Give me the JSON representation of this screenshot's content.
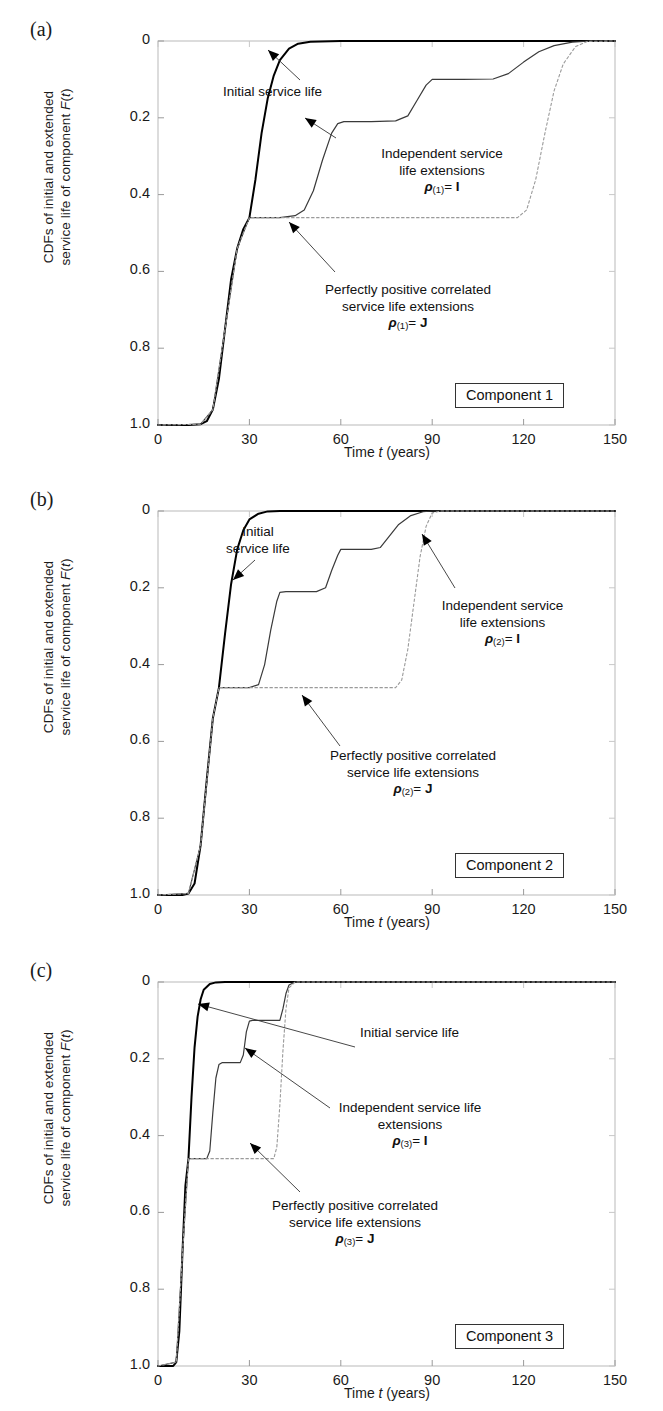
{
  "figure": {
    "panels": [
      {
        "letter": "(a)",
        "component_label": "Component 1",
        "ylabel_line1": "CDFs of initial and extended",
        "ylabel_line2_a": "service life of component ",
        "ylabel_line2_b": "F",
        "ylabel_line2_c": "(",
        "ylabel_line2_d": "t",
        "ylabel_line2_e": ")",
        "xlabel_a": "Time ",
        "xlabel_b": "t",
        "xlabel_c": " (years)",
        "yticks": [
          "1.0",
          "0.8",
          "0.6",
          "0.4",
          "0.2",
          "0"
        ],
        "xticks": [
          "0",
          "30",
          "60",
          "90",
          "120",
          "150"
        ],
        "annotations": [
          {
            "name": "initial-service-life",
            "lines": [
              "Initial service life"
            ]
          },
          {
            "name": "independent-extensions",
            "lines": [
              "Independent service",
              "life extensions"
            ],
            "rho": "ρ",
            "sub": "(1)",
            "eq": "= ",
            "matrix": "I"
          },
          {
            "name": "perfectly-correlated-extensions",
            "lines": [
              "Perfectly positive correlated",
              "service life extensions"
            ],
            "rho": "ρ",
            "sub": "(1)",
            "eq": "= ",
            "matrix": "J"
          }
        ]
      },
      {
        "letter": "(b)",
        "component_label": "Component 2",
        "ylabel_line1": "CDFs of initial and extended",
        "ylabel_line2_a": "service life of component ",
        "ylabel_line2_b": "F",
        "ylabel_line2_c": "(",
        "ylabel_line2_d": "t",
        "ylabel_line2_e": ")",
        "xlabel_a": "Time ",
        "xlabel_b": "t",
        "xlabel_c": " (years)",
        "yticks": [
          "1.0",
          "0.8",
          "0.6",
          "0.4",
          "0.2",
          "0"
        ],
        "xticks": [
          "0",
          "30",
          "60",
          "90",
          "120",
          "150"
        ],
        "annotations": [
          {
            "name": "initial-service-life",
            "lines": [
              "Initial",
              "service life"
            ]
          },
          {
            "name": "independent-extensions",
            "lines": [
              "Independent service",
              "life extensions"
            ],
            "rho": "ρ",
            "sub": "(2)",
            "eq": "= ",
            "matrix": "I"
          },
          {
            "name": "perfectly-correlated-extensions",
            "lines": [
              "Perfectly positive correlated",
              "service life extensions"
            ],
            "rho": "ρ",
            "sub": "(2)",
            "eq": "= ",
            "matrix": "J"
          }
        ]
      },
      {
        "letter": "(c)",
        "component_label": "Component 3",
        "ylabel_line1": "CDFs of initial and extended",
        "ylabel_line2_a": "service life of component ",
        "ylabel_line2_b": "F",
        "ylabel_line2_c": "(",
        "ylabel_line2_d": "t",
        "ylabel_line2_e": ")",
        "xlabel_a": "Time ",
        "xlabel_b": "t",
        "xlabel_c": " (years)",
        "yticks": [
          "1.0",
          "0.8",
          "0.6",
          "0.4",
          "0.2",
          "0"
        ],
        "xticks": [
          "0",
          "30",
          "60",
          "90",
          "120",
          "150"
        ],
        "annotations": [
          {
            "name": "initial-service-life",
            "lines": [
              "Initial service life"
            ]
          },
          {
            "name": "independent-extensions",
            "lines": [
              "Independent service life",
              "extensions"
            ],
            "rho": "ρ",
            "sub": "(3)",
            "eq": "= ",
            "matrix": "I"
          },
          {
            "name": "perfectly-correlated-extensions",
            "lines": [
              "Perfectly positive correlated",
              "service life extensions"
            ],
            "rho": "ρ",
            "sub": "(3)",
            "eq": "= ",
            "matrix": "J"
          }
        ]
      }
    ]
  },
  "chart_data": [
    {
      "type": "line",
      "panel": "(a)",
      "title": "Component 1",
      "xlabel": "Time t (years)",
      "ylabel": "CDFs of initial and extended service life of component F(t)",
      "xlim": [
        0,
        150
      ],
      "ylim": [
        0,
        1.0
      ],
      "xticks": [
        0,
        30,
        60,
        90,
        120,
        150
      ],
      "yticks": [
        0,
        0.2,
        0.4,
        0.6,
        0.8,
        1.0
      ],
      "grid": false,
      "legend": "annotations-inline",
      "series": [
        {
          "name": "Initial service life",
          "style": "solid-thick",
          "color": "#000000",
          "points": [
            [
              0,
              0.0
            ],
            [
              10,
              0.0
            ],
            [
              14,
              0.002
            ],
            [
              16,
              0.01
            ],
            [
              18,
              0.04
            ],
            [
              20,
              0.12
            ],
            [
              22,
              0.25
            ],
            [
              24,
              0.38
            ],
            [
              26,
              0.46
            ],
            [
              28,
              0.51
            ],
            [
              30,
              0.54
            ],
            [
              32,
              0.64
            ],
            [
              34,
              0.76
            ],
            [
              36,
              0.85
            ],
            [
              38,
              0.91
            ],
            [
              40,
              0.95
            ],
            [
              43,
              0.98
            ],
            [
              46,
              0.993
            ],
            [
              50,
              0.998
            ],
            [
              60,
              1.0
            ],
            [
              150,
              1.0
            ]
          ]
        },
        {
          "name": "Independent service life extensions, rho_(1) = I",
          "style": "solid-thin",
          "color": "#3a3a3a",
          "points": [
            [
              0,
              0.0
            ],
            [
              14,
              0.002
            ],
            [
              18,
              0.04
            ],
            [
              22,
              0.25
            ],
            [
              26,
              0.46
            ],
            [
              30,
              0.54
            ],
            [
              40,
              0.54
            ],
            [
              45,
              0.545
            ],
            [
              48,
              0.56
            ],
            [
              51,
              0.61
            ],
            [
              54,
              0.69
            ],
            [
              57,
              0.76
            ],
            [
              59,
              0.785
            ],
            [
              61,
              0.79
            ],
            [
              70,
              0.79
            ],
            [
              78,
              0.792
            ],
            [
              82,
              0.805
            ],
            [
              85,
              0.845
            ],
            [
              88,
              0.885
            ],
            [
              90,
              0.9
            ],
            [
              100,
              0.9
            ],
            [
              110,
              0.901
            ],
            [
              115,
              0.915
            ],
            [
              120,
              0.945
            ],
            [
              125,
              0.972
            ],
            [
              130,
              0.988
            ],
            [
              136,
              0.997
            ],
            [
              142,
              1.0
            ],
            [
              150,
              1.0
            ]
          ]
        },
        {
          "name": "Perfectly positive correlated service life extensions, rho_(1) = J",
          "style": "dotted",
          "color": "#9a9a9a",
          "points": [
            [
              0,
              0.0
            ],
            [
              14,
              0.002
            ],
            [
              18,
              0.04
            ],
            [
              22,
              0.25
            ],
            [
              26,
              0.46
            ],
            [
              30,
              0.54
            ],
            [
              60,
              0.54
            ],
            [
              90,
              0.54
            ],
            [
              118,
              0.54
            ],
            [
              121,
              0.56
            ],
            [
              124,
              0.64
            ],
            [
              127,
              0.76
            ],
            [
              130,
              0.87
            ],
            [
              133,
              0.94
            ],
            [
              137,
              0.985
            ],
            [
              141,
              0.999
            ],
            [
              150,
              1.0
            ]
          ]
        }
      ]
    },
    {
      "type": "line",
      "panel": "(b)",
      "title": "Component 2",
      "xlabel": "Time t (years)",
      "ylabel": "CDFs of initial and extended service life of component F(t)",
      "xlim": [
        0,
        150
      ],
      "ylim": [
        0,
        1.0
      ],
      "xticks": [
        0,
        30,
        60,
        90,
        120,
        150
      ],
      "yticks": [
        0,
        0.2,
        0.4,
        0.6,
        0.8,
        1.0
      ],
      "grid": false,
      "legend": "annotations-inline",
      "series": [
        {
          "name": "Initial service life",
          "style": "solid-thick",
          "color": "#000000",
          "points": [
            [
              0,
              0.0
            ],
            [
              8,
              0.0
            ],
            [
              10,
              0.004
            ],
            [
              12,
              0.03
            ],
            [
              14,
              0.13
            ],
            [
              16,
              0.3
            ],
            [
              18,
              0.46
            ],
            [
              20,
              0.54
            ],
            [
              22,
              0.68
            ],
            [
              24,
              0.81
            ],
            [
              26,
              0.9
            ],
            [
              28,
              0.95
            ],
            [
              30,
              0.978
            ],
            [
              33,
              0.993
            ],
            [
              36,
              0.999
            ],
            [
              40,
              1.0
            ],
            [
              150,
              1.0
            ]
          ]
        },
        {
          "name": "Independent service life extensions, rho_(2) = I",
          "style": "solid-thin",
          "color": "#3a3a3a",
          "points": [
            [
              0,
              0.0
            ],
            [
              10,
              0.004
            ],
            [
              14,
              0.13
            ],
            [
              18,
              0.46
            ],
            [
              20,
              0.54
            ],
            [
              30,
              0.54
            ],
            [
              33,
              0.548
            ],
            [
              35,
              0.6
            ],
            [
              37,
              0.69
            ],
            [
              39,
              0.765
            ],
            [
              40,
              0.788
            ],
            [
              42,
              0.79
            ],
            [
              52,
              0.79
            ],
            [
              55,
              0.8
            ],
            [
              57,
              0.845
            ],
            [
              59,
              0.885
            ],
            [
              60,
              0.9
            ],
            [
              70,
              0.9
            ],
            [
              73,
              0.905
            ],
            [
              76,
              0.935
            ],
            [
              79,
              0.965
            ],
            [
              83,
              0.988
            ],
            [
              87,
              0.998
            ],
            [
              90,
              1.0
            ],
            [
              150,
              1.0
            ]
          ]
        },
        {
          "name": "Perfectly positive correlated service life extensions, rho_(2) = J",
          "style": "dotted",
          "color": "#9a9a9a",
          "points": [
            [
              0,
              0.0
            ],
            [
              10,
              0.004
            ],
            [
              14,
              0.13
            ],
            [
              18,
              0.46
            ],
            [
              20,
              0.54
            ],
            [
              50,
              0.54
            ],
            [
              78,
              0.54
            ],
            [
              80,
              0.56
            ],
            [
              82,
              0.64
            ],
            [
              84,
              0.76
            ],
            [
              86,
              0.88
            ],
            [
              88,
              0.96
            ],
            [
              90,
              0.995
            ],
            [
              93,
              1.0
            ],
            [
              150,
              1.0
            ]
          ]
        }
      ]
    },
    {
      "type": "line",
      "panel": "(c)",
      "title": "Component 3",
      "xlabel": "Time t (years)",
      "ylabel": "CDFs of initial and extended service life of component F(t)",
      "xlim": [
        0,
        150
      ],
      "ylim": [
        0,
        1.0
      ],
      "xticks": [
        0,
        30,
        60,
        90,
        120,
        150
      ],
      "yticks": [
        0,
        0.2,
        0.4,
        0.6,
        0.8,
        1.0
      ],
      "grid": false,
      "legend": "annotations-inline",
      "series": [
        {
          "name": "Initial service life",
          "style": "solid-thick",
          "color": "#000000",
          "points": [
            [
              0,
              0.0
            ],
            [
              5,
              0.0
            ],
            [
              6,
              0.01
            ],
            [
              7,
              0.09
            ],
            [
              8,
              0.29
            ],
            [
              9,
              0.47
            ],
            [
              10,
              0.54
            ],
            [
              11,
              0.7
            ],
            [
              12,
              0.83
            ],
            [
              13,
              0.91
            ],
            [
              14,
              0.955
            ],
            [
              15,
              0.98
            ],
            [
              17,
              0.995
            ],
            [
              19,
              0.999
            ],
            [
              22,
              1.0
            ],
            [
              150,
              1.0
            ]
          ]
        },
        {
          "name": "Independent service life extensions, rho_(3) = I",
          "style": "solid-thin",
          "color": "#3a3a3a",
          "points": [
            [
              0,
              0.0
            ],
            [
              6,
              0.01
            ],
            [
              8,
              0.29
            ],
            [
              10,
              0.54
            ],
            [
              16,
              0.54
            ],
            [
              17,
              0.56
            ],
            [
              18,
              0.66
            ],
            [
              19,
              0.75
            ],
            [
              20,
              0.785
            ],
            [
              21,
              0.79
            ],
            [
              27,
              0.79
            ],
            [
              28,
              0.81
            ],
            [
              29,
              0.87
            ],
            [
              30,
              0.898
            ],
            [
              31,
              0.9
            ],
            [
              40,
              0.9
            ],
            [
              41,
              0.93
            ],
            [
              42,
              0.97
            ],
            [
              43,
              0.992
            ],
            [
              45,
              1.0
            ],
            [
              150,
              1.0
            ]
          ]
        },
        {
          "name": "Perfectly positive correlated service life extensions, rho_(3) = J",
          "style": "dotted",
          "color": "#9a9a9a",
          "points": [
            [
              0,
              0.0
            ],
            [
              6,
              0.01
            ],
            [
              8,
              0.29
            ],
            [
              10,
              0.54
            ],
            [
              25,
              0.54
            ],
            [
              38,
              0.54
            ],
            [
              39,
              0.57
            ],
            [
              40,
              0.68
            ],
            [
              41,
              0.82
            ],
            [
              42,
              0.93
            ],
            [
              43,
              0.985
            ],
            [
              45,
              1.0
            ],
            [
              150,
              1.0
            ]
          ]
        }
      ]
    }
  ]
}
